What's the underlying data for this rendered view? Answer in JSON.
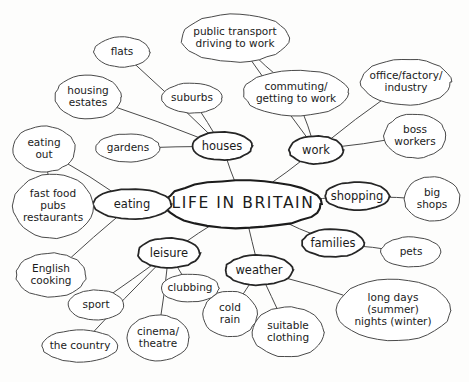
{
  "diagram": {
    "title": "LIFE IN BRITAIN",
    "style": "hand-drawn mind map",
    "background_color": "#fdfdfc",
    "stroke_color": "#3c3c3c",
    "text_color": "#1b1b1b",
    "width": 469,
    "height": 382
  },
  "nodes": [
    {
      "id": "center",
      "label": "LIFE IN BRITAIN",
      "level": 0,
      "cx": 243,
      "cy": 204,
      "rx": 79,
      "ry": 24
    },
    {
      "id": "houses",
      "label": "houses",
      "level": 1,
      "cx": 222,
      "cy": 146,
      "rx": 30,
      "ry": 14
    },
    {
      "id": "work",
      "label": "work",
      "level": 1,
      "cx": 316,
      "cy": 150,
      "rx": 27,
      "ry": 14
    },
    {
      "id": "eating",
      "label": "eating",
      "level": 1,
      "cx": 132,
      "cy": 204,
      "rx": 39,
      "ry": 15
    },
    {
      "id": "leisure",
      "label": "leisure",
      "level": 1,
      "cx": 169,
      "cy": 253,
      "rx": 31,
      "ry": 15
    },
    {
      "id": "weather",
      "label": "weather",
      "level": 1,
      "cx": 259,
      "cy": 270,
      "rx": 34,
      "ry": 15
    },
    {
      "id": "shopping",
      "label": "shopping",
      "level": 1,
      "cx": 357,
      "cy": 196,
      "rx": 32,
      "ry": 14
    },
    {
      "id": "families",
      "label": "families",
      "level": 1,
      "cx": 333,
      "cy": 243,
      "rx": 31,
      "ry": 14
    },
    {
      "id": "flats",
      "label": "flats",
      "level": 2,
      "cx": 122,
      "cy": 52,
      "rx": 28,
      "ry": 15
    },
    {
      "id": "housing_estates",
      "label": "housing\nestates",
      "level": 2,
      "cx": 88,
      "cy": 97,
      "rx": 33,
      "ry": 22
    },
    {
      "id": "suburbs",
      "label": "suburbs",
      "level": 2,
      "cx": 192,
      "cy": 98,
      "rx": 30,
      "ry": 15
    },
    {
      "id": "gardens",
      "label": "gardens",
      "level": 2,
      "cx": 128,
      "cy": 148,
      "rx": 32,
      "ry": 14
    },
    {
      "id": "public_transport",
      "label": "public transport\ndriving to work",
      "level": 2,
      "cx": 235,
      "cy": 38,
      "rx": 54,
      "ry": 24
    },
    {
      "id": "commuting",
      "label": "commuting/\ngetting to work",
      "level": 2,
      "cx": 296,
      "cy": 93,
      "rx": 53,
      "ry": 23
    },
    {
      "id": "office_factory",
      "label": "office/factory/\nindustry",
      "level": 2,
      "cx": 406,
      "cy": 82,
      "rx": 45,
      "ry": 23
    },
    {
      "id": "boss_workers",
      "label": "boss\nworkers",
      "level": 2,
      "cx": 415,
      "cy": 136,
      "rx": 31,
      "ry": 22
    },
    {
      "id": "big_shops",
      "label": "big\nshops",
      "level": 2,
      "cx": 432,
      "cy": 199,
      "rx": 28,
      "ry": 22
    },
    {
      "id": "pets",
      "label": "pets",
      "level": 2,
      "cx": 411,
      "cy": 252,
      "rx": 30,
      "ry": 15
    },
    {
      "id": "eating_out",
      "label": "eating\nout",
      "level": 2,
      "cx": 44,
      "cy": 149,
      "rx": 31,
      "ry": 23
    },
    {
      "id": "fast_food",
      "label": "fast food\npubs\nrestaurants",
      "level": 2,
      "cx": 53,
      "cy": 206,
      "rx": 40,
      "ry": 32
    },
    {
      "id": "english_cooking",
      "label": "English\ncooking",
      "level": 2,
      "cx": 51,
      "cy": 275,
      "rx": 35,
      "ry": 22
    },
    {
      "id": "sport",
      "label": "sport",
      "level": 2,
      "cx": 96,
      "cy": 305,
      "rx": 28,
      "ry": 15
    },
    {
      "id": "the_country",
      "label": "the country",
      "level": 2,
      "cx": 80,
      "cy": 346,
      "rx": 38,
      "ry": 16
    },
    {
      "id": "cinema_theatre",
      "label": "cinema/\ntheatre",
      "level": 2,
      "cx": 158,
      "cy": 338,
      "rx": 31,
      "ry": 23
    },
    {
      "id": "clubbing",
      "label": "clubbing",
      "level": 2,
      "cx": 190,
      "cy": 288,
      "rx": 29,
      "ry": 14
    },
    {
      "id": "cold_rain",
      "label": "cold\nrain",
      "level": 2,
      "cx": 230,
      "cy": 314,
      "rx": 27,
      "ry": 23
    },
    {
      "id": "suitable_clothing",
      "label": "suitable\nclothing",
      "level": 2,
      "cx": 288,
      "cy": 332,
      "rx": 36,
      "ry": 25
    },
    {
      "id": "long_days",
      "label": "long days\n(summer)\nnights (winter)",
      "level": 2,
      "cx": 393,
      "cy": 310,
      "rx": 57,
      "ry": 31
    }
  ],
  "edges": [
    {
      "from": "center",
      "to": "houses"
    },
    {
      "from": "center",
      "to": "work"
    },
    {
      "from": "center",
      "to": "eating"
    },
    {
      "from": "center",
      "to": "leisure"
    },
    {
      "from": "center",
      "to": "weather"
    },
    {
      "from": "center",
      "to": "shopping"
    },
    {
      "from": "center",
      "to": "families"
    },
    {
      "from": "houses",
      "to": "flats"
    },
    {
      "from": "houses",
      "to": "housing_estates"
    },
    {
      "from": "houses",
      "to": "suburbs"
    },
    {
      "from": "houses",
      "to": "gardens"
    },
    {
      "from": "work",
      "to": "public_transport"
    },
    {
      "from": "work",
      "to": "commuting"
    },
    {
      "from": "work",
      "to": "office_factory"
    },
    {
      "from": "work",
      "to": "boss_workers"
    },
    {
      "from": "shopping",
      "to": "big_shops"
    },
    {
      "from": "families",
      "to": "pets"
    },
    {
      "from": "eating",
      "to": "eating_out"
    },
    {
      "from": "eating",
      "to": "fast_food"
    },
    {
      "from": "eating",
      "to": "english_cooking"
    },
    {
      "from": "eating_out",
      "to": "fast_food"
    },
    {
      "from": "leisure",
      "to": "sport"
    },
    {
      "from": "leisure",
      "to": "the_country"
    },
    {
      "from": "leisure",
      "to": "cinema_theatre"
    },
    {
      "from": "leisure",
      "to": "clubbing"
    },
    {
      "from": "weather",
      "to": "cold_rain"
    },
    {
      "from": "weather",
      "to": "suitable_clothing"
    },
    {
      "from": "weather",
      "to": "long_days"
    },
    {
      "from": "commuting",
      "to": "public_transport"
    }
  ]
}
